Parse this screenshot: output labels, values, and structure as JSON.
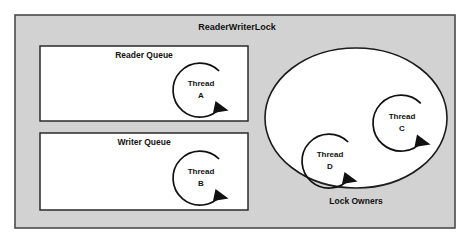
{
  "diagram": {
    "type": "concept-diagram",
    "title": "ReaderWriterLock",
    "colors": {
      "frame_fill": "#d2d2d2",
      "frame_stroke": "#4a4a4a",
      "box_fill": "#ffffff",
      "box_stroke": "#2b2b2b",
      "ellipse_fill": "#ffffff",
      "ellipse_stroke": "#1c1c1c",
      "text": "#111111",
      "page_background": "#ffffff"
    },
    "outer_frame": {
      "label": "ReaderWriterLock"
    },
    "queues": [
      {
        "name": "reader-queue",
        "label": "Reader Queue",
        "thread": {
          "name_line1": "Thread",
          "name_line2": "A"
        }
      },
      {
        "name": "writer-queue",
        "label": "Writer Queue",
        "thread": {
          "name_line1": "Thread",
          "name_line2": "B"
        }
      }
    ],
    "lock_owners": {
      "label": "Lock Owners",
      "threads": [
        {
          "name": "thread-c",
          "name_line1": "Thread",
          "name_line2": "C"
        },
        {
          "name": "thread-d",
          "name_line1": "Thread",
          "name_line2": "D"
        }
      ]
    },
    "icons": {
      "thread_loop": "circular-arrow-icon"
    }
  }
}
